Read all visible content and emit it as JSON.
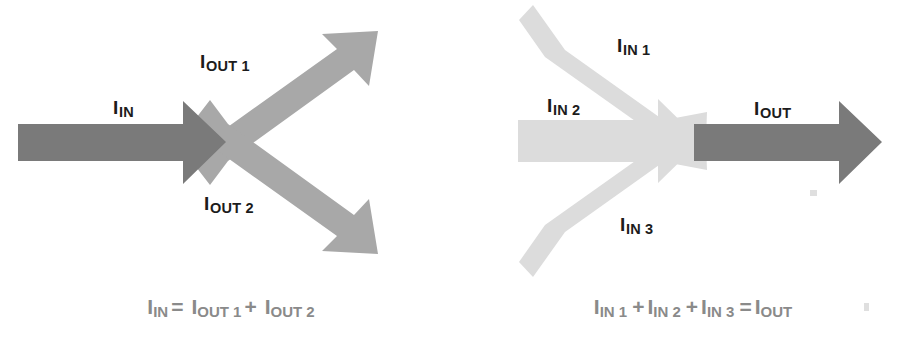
{
  "figure": {
    "background_color": "#ffffff",
    "colors": {
      "dark_arrow": "#7a7a7a",
      "mid_arrow": "#a8a8a8",
      "light_arrow": "#dcdcdc",
      "label_text": "#1c1c1c",
      "equation_text": "#8a8a8a"
    }
  },
  "left_panel": {
    "name": "current-splitting-diagram",
    "arrows": [
      {
        "id": "i-in",
        "shade": "dark",
        "direction": "right",
        "label_base": "I",
        "label_sub": "IN"
      },
      {
        "id": "i-out-1",
        "shade": "mid",
        "direction": "up-right",
        "label_base": "I",
        "label_sub": "OUT 1"
      },
      {
        "id": "i-out-2",
        "shade": "mid",
        "direction": "down-right",
        "label_base": "I",
        "label_sub": "OUT 2"
      }
    ],
    "labels": {
      "in": {
        "base": "I",
        "sub": "IN"
      },
      "out_1": {
        "base": "I",
        "sub": "OUT 1"
      },
      "out_2": {
        "base": "I",
        "sub": "OUT 2"
      }
    },
    "equation": {
      "terms": [
        {
          "base": "I",
          "sub": "IN"
        },
        {
          "base": "I",
          "sub": "OUT 1"
        },
        {
          "base": "I",
          "sub": "OUT 2"
        }
      ],
      "operators": {
        "equals": "=",
        "plus": "+"
      },
      "plain_text": "I_IN = I_OUT1 + I_OUT2"
    }
  },
  "right_panel": {
    "name": "current-combining-diagram",
    "arrows": [
      {
        "id": "i-in-1",
        "shade": "light",
        "direction": "down-right",
        "label_base": "I",
        "label_sub": "IN 1"
      },
      {
        "id": "i-in-2",
        "shade": "light",
        "direction": "right",
        "label_base": "I",
        "label_sub": "IN 2"
      },
      {
        "id": "i-in-3",
        "shade": "light",
        "direction": "up-right",
        "label_base": "I",
        "label_sub": "IN 3"
      },
      {
        "id": "i-out",
        "shade": "dark",
        "direction": "right",
        "label_base": "I",
        "label_sub": "OUT"
      }
    ],
    "labels": {
      "in_1": {
        "base": "I",
        "sub": "IN 1"
      },
      "in_2": {
        "base": "I",
        "sub": "IN 2"
      },
      "in_3": {
        "base": "I",
        "sub": "IN 3"
      },
      "out": {
        "base": "I",
        "sub": "OUT"
      }
    },
    "equation": {
      "terms": [
        {
          "base": "I",
          "sub": "IN 1"
        },
        {
          "base": "I",
          "sub": "IN 2"
        },
        {
          "base": "I",
          "sub": "IN 3"
        },
        {
          "base": "I",
          "sub": "OUT"
        }
      ],
      "operators": {
        "equals": "=",
        "plus": "+"
      },
      "plain_text": "I_IN1 + I_IN2 + I_IN3 = I_OUT"
    }
  }
}
